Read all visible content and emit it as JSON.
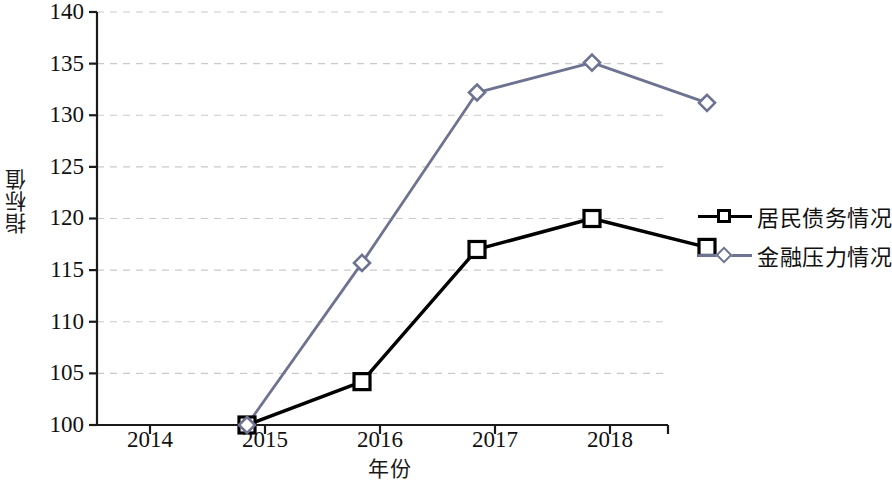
{
  "chart_data": {
    "type": "line",
    "title": "",
    "xlabel": "年份",
    "ylabel": "指标值",
    "categories": [
      "2014",
      "2015",
      "2016",
      "2017",
      "2018"
    ],
    "x": [
      2014,
      2015,
      2016,
      2017,
      2018
    ],
    "ylim": [
      100,
      140
    ],
    "yticks": [
      100,
      105,
      110,
      115,
      120,
      125,
      130,
      135,
      140
    ],
    "ytick_labels": [
      "100",
      "105",
      "110",
      "115",
      "120",
      "125",
      "130",
      "135",
      "140"
    ],
    "grid": "horizontal-dashed",
    "legend_position": "right",
    "series": [
      {
        "name": "居民债务情况",
        "values": [
          100,
          104.2,
          117,
          120,
          117.2
        ],
        "color": "#000000",
        "marker": "open-square"
      },
      {
        "name": "金融压力情况",
        "values": [
          100,
          115.7,
          132.2,
          135.1,
          131.2
        ],
        "color": "#6d7390",
        "marker": "open-diamond"
      }
    ]
  },
  "legend": {
    "items": [
      {
        "label": "居民债务情况",
        "marker": "square-marker-icon",
        "color": "#000000"
      },
      {
        "label": "金融压力情况",
        "marker": "diamond-marker-icon",
        "color": "#6d7390"
      }
    ]
  },
  "axes": {
    "y_axis_title": "指标值",
    "x_axis_title": "年份"
  }
}
